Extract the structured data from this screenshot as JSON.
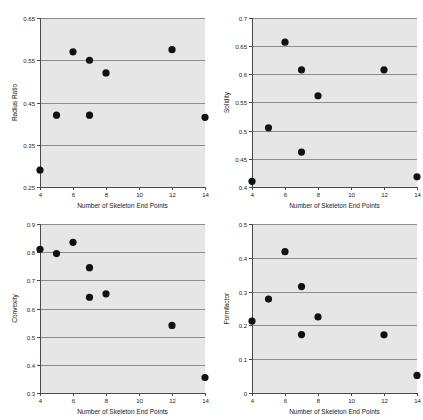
{
  "figure": {
    "background_color": "#ffffff",
    "plot_background_color": "#e6e6e6",
    "gridline_color": "#8c8c8c",
    "marker_color": "#111111",
    "panel_count": 4
  },
  "chart_data": [
    {
      "type": "scatter",
      "panel": "top-left",
      "title": "",
      "xlabel": "Number of Skeleton End Points",
      "ylabel": "Radius Ratio",
      "xlim": [
        4,
        14
      ],
      "ylim": [
        0.25,
        0.65
      ],
      "xticks": [
        4,
        6,
        8,
        10,
        12,
        14
      ],
      "xticklabels": [
        "4",
        "6",
        "8",
        "10",
        "12",
        "14"
      ],
      "yticks": [
        0.25,
        0.35,
        0.45,
        0.55,
        0.65
      ],
      "yticklabels": [
        "0.25",
        "0.35",
        "0.45",
        "0.55",
        "0.65"
      ],
      "grid": true,
      "legend": "none",
      "x": [
        4,
        5,
        6,
        7,
        7,
        8,
        12,
        14
      ],
      "y": [
        0.29,
        0.42,
        0.57,
        0.55,
        0.42,
        0.52,
        0.575,
        0.415
      ]
    },
    {
      "type": "scatter",
      "panel": "top-right",
      "title": "",
      "xlabel": "Number of Skeleton End Points",
      "ylabel": "Solidity",
      "xlim": [
        4,
        14
      ],
      "ylim": [
        0.4,
        0.7
      ],
      "xticks": [
        4,
        6,
        8,
        10,
        12,
        14
      ],
      "xticklabels": [
        "4",
        "6",
        "8",
        "10",
        "12",
        "14"
      ],
      "yticks": [
        0.4,
        0.45,
        0.5,
        0.55,
        0.6,
        0.65,
        0.7
      ],
      "yticklabels": [
        "0.4",
        "0.45",
        "0.5",
        "0.55",
        "0.6",
        "0.65",
        "0.7"
      ],
      "grid": true,
      "legend": "none",
      "x": [
        4,
        5,
        6,
        7,
        7,
        8,
        12,
        14
      ],
      "y": [
        0.41,
        0.505,
        0.657,
        0.608,
        0.462,
        0.562,
        0.608,
        0.418
      ]
    },
    {
      "type": "scatter",
      "panel": "bottom-left",
      "title": "",
      "xlabel": "Number of Skeleton End Points",
      "ylabel": "Convexity",
      "xlim": [
        4,
        14
      ],
      "ylim": [
        0.3,
        0.9
      ],
      "xticks": [
        4,
        6,
        8,
        10,
        12,
        14
      ],
      "xticklabels": [
        "4",
        "6",
        "8",
        "10",
        "12",
        "14"
      ],
      "yticks": [
        0.3,
        0.4,
        0.5,
        0.6,
        0.7,
        0.8,
        0.9
      ],
      "yticklabels": [
        "0.3",
        "0.4",
        "0.5",
        "0.6",
        "0.7",
        "0.8",
        "0.9"
      ],
      "grid": true,
      "legend": "none",
      "x": [
        4,
        5,
        6,
        7,
        7,
        8,
        12,
        14
      ],
      "y": [
        0.81,
        0.795,
        0.835,
        0.745,
        0.64,
        0.652,
        0.54,
        0.355
      ]
    },
    {
      "type": "scatter",
      "panel": "bottom-right",
      "title": "",
      "xlabel": "Number of Skeleton End Points",
      "ylabel": "Formfactor",
      "xlim": [
        4,
        14
      ],
      "ylim": [
        0,
        0.5
      ],
      "xticks": [
        4,
        6,
        8,
        10,
        12,
        14
      ],
      "xticklabels": [
        "4",
        "6",
        "8",
        "10",
        "12",
        "14"
      ],
      "yticks": [
        0,
        0.1,
        0.2,
        0.3,
        0.4,
        0.5
      ],
      "yticklabels": [
        "0",
        "0.1",
        "0.2",
        "0.3",
        "0.4",
        "0.5"
      ],
      "grid": true,
      "legend": "none",
      "x": [
        4,
        5,
        6,
        7,
        7,
        8,
        12,
        14
      ],
      "y": [
        0.213,
        0.278,
        0.418,
        0.315,
        0.173,
        0.225,
        0.172,
        0.052
      ]
    }
  ]
}
